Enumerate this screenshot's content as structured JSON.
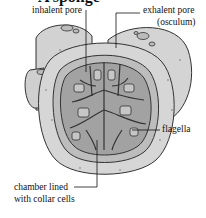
{
  "figure": {
    "title": "A sponge",
    "labels": {
      "inhalent_pore": "inhalent pore",
      "exhalent_pore": "exhalent pore",
      "osculum": "(osculum)",
      "flagella": "flagella",
      "chamber_line1": "chamber lined",
      "chamber_line2": "with collar cells"
    },
    "colors": {
      "outer_body": "#d4d4d4",
      "inner_wall": "#bdbdbd",
      "cavity": "#9e9e9e",
      "canals": "#c8c8c8",
      "outline": "#333333"
    }
  }
}
